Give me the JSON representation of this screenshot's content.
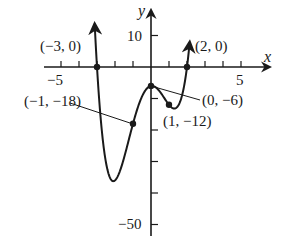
{
  "chart_data": {
    "type": "line",
    "title": "",
    "xlabel": "x",
    "ylabel": "y",
    "xlim": [
      -5.5,
      6.5
    ],
    "ylim": [
      -54,
      18
    ],
    "x_ticks": [
      -5,
      -4,
      -3,
      -2,
      -1,
      1,
      2,
      3,
      4,
      5
    ],
    "x_tick_labels": [
      {
        "value": -5,
        "text": "−5"
      },
      {
        "value": 5,
        "text": "5"
      }
    ],
    "y_ticks": [
      10,
      -10,
      -20,
      -30,
      -40,
      -50
    ],
    "y_tick_labels": [
      {
        "value": 10,
        "text": "10"
      },
      {
        "value": -50,
        "text": "−50"
      }
    ],
    "grid": false,
    "series": [
      {
        "name": "f(x)",
        "x": [
          -3.1,
          -3.0,
          -2.9,
          -2.8,
          -2.7,
          -2.6,
          -2.5,
          -2.4,
          -2.3,
          -2.25,
          -2.2,
          -2.1,
          -2.0,
          -1.9,
          -1.8,
          -1.7,
          -1.6,
          -1.5,
          -1.4,
          -1.3,
          -1.2,
          -1.1,
          -1.0,
          -0.9,
          -0.8,
          -0.7,
          -0.6,
          -0.5,
          -0.4,
          -0.3,
          -0.2,
          -0.1,
          0.0,
          0.1,
          0.2,
          0.3,
          0.4,
          0.5,
          0.6,
          0.7,
          0.8,
          0.9,
          1.0,
          1.1,
          1.2,
          1.3,
          1.4,
          1.5,
          1.6,
          1.7,
          1.8,
          1.9,
          2.0,
          2.1,
          2.2
        ],
        "values": [
          9.92,
          0,
          -8.7,
          -16.17,
          -22.45,
          -27.57,
          -31.59,
          -34.57,
          -36.27,
          -35.57,
          -36.94,
          -36.08,
          -34.0,
          -31.05,
          -27.52,
          -23.67,
          -19.7,
          -15.79,
          -12.06,
          -8.6,
          -5.47,
          -2.76,
          -18.0,
          0,
          0,
          0,
          0,
          0,
          0,
          0,
          0,
          0,
          -6,
          0,
          0,
          0,
          0,
          0,
          0,
          0,
          0,
          0,
          -12,
          0,
          0,
          0,
          0,
          0,
          0,
          0,
          0,
          0,
          0,
          0,
          0
        ],
        "formula": "(x+3)(x-2)(2x^2+1)",
        "note": "curve rendered from formula; arrows at both ends pointing upward"
      }
    ],
    "annotations": [
      {
        "text": "(−3, 0)",
        "point": [
          -3,
          0
        ]
      },
      {
        "text": "(2, 0)",
        "point": [
          2,
          0
        ]
      },
      {
        "text": "(−1, −18)",
        "point": [
          -1,
          -18
        ]
      },
      {
        "text": "(0, −6)",
        "point": [
          0,
          -6
        ]
      },
      {
        "text": "(1, −12)",
        "point": [
          1,
          -12
        ]
      }
    ]
  },
  "labels": {
    "x_axis": "x",
    "y_axis": "y",
    "y_top": "10",
    "y_bottom": "−50",
    "x_left": "−5",
    "x_right": "5",
    "pt_m3": "(−3, 0)",
    "pt_2": "(2, 0)",
    "pt_m1": "(−1, −18)",
    "pt_0": "(0, −6)",
    "pt_1": "(1, −12)"
  }
}
